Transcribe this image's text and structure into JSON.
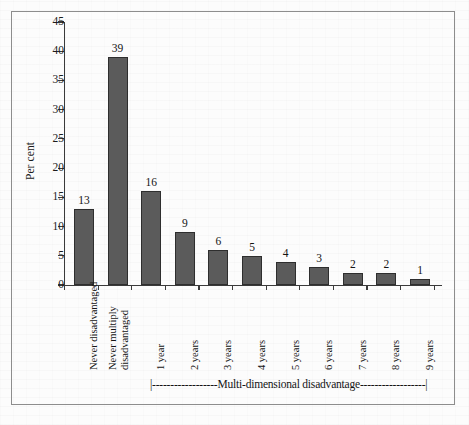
{
  "figure": {
    "background_color": "#fdfdfd",
    "frame_color": "#8d8d8d",
    "bar_color": "#5b5b5b",
    "bar_border_color": "#2e2e2e",
    "axis_color": "#3a3a3a"
  },
  "annotation": {
    "bracket_text": "|------------------Multi-dimensional disadvantage------------------|",
    "label": "Multi-dimensional disadvantage"
  },
  "chart_data": {
    "type": "bar",
    "title": "",
    "subtitle": "",
    "xlabel": "",
    "ylabel": "Per cent",
    "ylim": [
      0,
      45
    ],
    "ytick_step": 5,
    "yticks": [
      "0",
      "5",
      "10",
      "15",
      "20",
      "25",
      "30",
      "35",
      "40",
      "45"
    ],
    "grid": false,
    "legend": false,
    "categories": [
      "Never disadvantaged",
      "Never multiply disadvantaged",
      "1 year",
      "2 years",
      "3 years",
      "4 years",
      "5 years",
      "6 years",
      "7 years",
      "8 years",
      "9 years"
    ],
    "values": [
      13,
      39,
      16,
      9,
      6,
      5,
      4,
      3,
      2,
      2,
      1
    ],
    "data_labels": [
      "13",
      "39",
      "16",
      "9",
      "6",
      "5",
      "4",
      "3",
      "2",
      "2",
      "1"
    ],
    "annotations": [
      {
        "text": "Multi-dimensional disadvantage",
        "spans_categories": [
          "1 year",
          "9 years"
        ],
        "style": "bracket-below-axis"
      }
    ]
  }
}
